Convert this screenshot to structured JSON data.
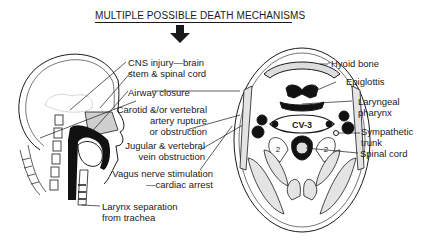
{
  "title": "MULTIPLE POSSIBLE DEATH MECHANISMS",
  "left_labels": {
    "cns": [
      "CNS injury—brain",
      "stem & spinal cord"
    ],
    "airway": "Airway closure",
    "carotid": [
      "Carotid &/or vertebral",
      "artery rupture",
      "or obstruction"
    ],
    "jugular": [
      "Jugular & vertebral",
      "vein obstruction"
    ],
    "vagus": [
      "Vagus nerve stimulation",
      "—cardiac arrest"
    ],
    "larynx": [
      "Larynx separation",
      "from trachea"
    ]
  },
  "right_labels": {
    "hyoid": "Hyoid bone",
    "epiglottis": "Epiglottis",
    "laryngeal": [
      "Laryngeal",
      "pharynx"
    ],
    "sympathetic": [
      "Sympathetic",
      "trunk"
    ],
    "spinal": "Spinal cord"
  },
  "vertebra_label": "CV-3",
  "muscle_label": "2",
  "icons": {
    "arrow": "down-arrow-icon"
  }
}
